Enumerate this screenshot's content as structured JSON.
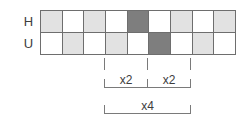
{
  "diagram": {
    "type": "timing-grid-diagram",
    "rows": [
      {
        "label": "H",
        "name": "row-h",
        "cells": [
          "light",
          "white",
          "light",
          "white",
          "dark",
          "white",
          "light",
          "white",
          "light"
        ]
      },
      {
        "label": "U",
        "name": "row-u",
        "cells": [
          "white",
          "light",
          "white",
          "light",
          "white",
          "dark",
          "white",
          "light",
          "white"
        ]
      }
    ],
    "column_count": 9,
    "colors": {
      "white": "#ffffff",
      "light": "#e2e2e2",
      "dark": "#7e7e7e",
      "stroke": "#6e6e6e",
      "annotation_stroke": "#7a7a7a",
      "text": "#3d3d3d"
    },
    "annotations": [
      {
        "name": "bracket-x2-left",
        "label": "x2",
        "span_columns": [
          4,
          5
        ]
      },
      {
        "name": "bracket-x2-right",
        "label": "x2",
        "span_columns": [
          6,
          7
        ]
      },
      {
        "name": "bracket-x4",
        "label": "x4",
        "span_columns": [
          4,
          7
        ]
      }
    ]
  }
}
